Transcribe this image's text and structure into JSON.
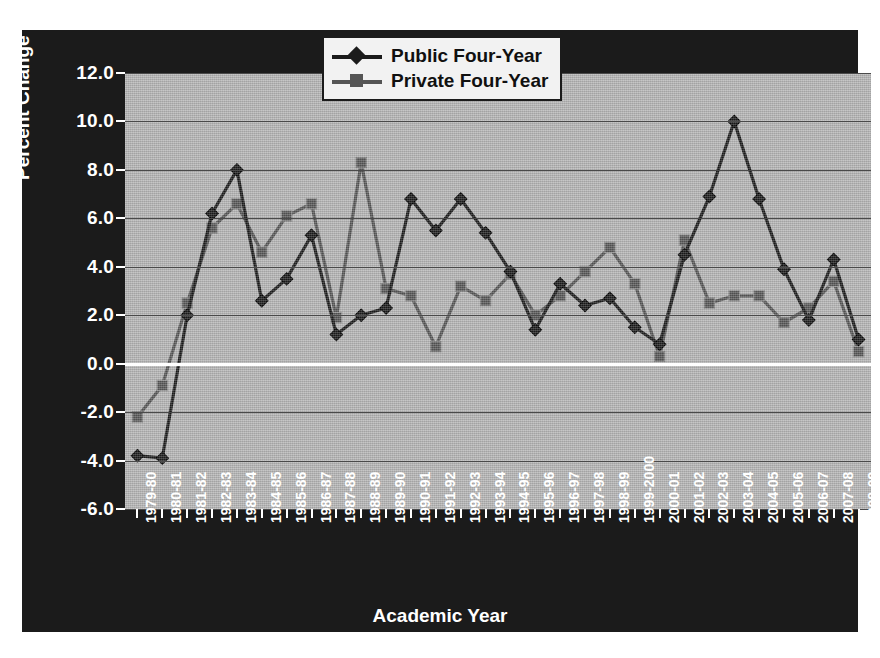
{
  "chart_data": {
    "type": "line",
    "title": "",
    "xlabel": "Academic Year",
    "ylabel": "Percent Change in Inflation-Adjusted Dollars",
    "ylim": [
      -6.0,
      12.0
    ],
    "ytick_step": 2.0,
    "ytick_labels": [
      "12.0",
      "10.0",
      "8.0",
      "6.0",
      "4.0",
      "2.0",
      "0.0",
      "-2.0",
      "-4.0",
      "-6.0"
    ],
    "ytick_values": [
      12.0,
      10.0,
      8.0,
      6.0,
      4.0,
      2.0,
      0.0,
      -2.0,
      -4.0,
      -6.0
    ],
    "grid": true,
    "zero_line": true,
    "legend_position": "top-center",
    "categories": [
      "1979-80",
      "1980-81",
      "1981-82",
      "1982-83",
      "1983-84",
      "1984-85",
      "1985-86",
      "1986-87",
      "1987-88",
      "1988-89",
      "1989-90",
      "1990-91",
      "1991-92",
      "1992-93",
      "1993-94",
      "1994-95",
      "1995-96",
      "1996-97",
      "1997-98",
      "1998-99",
      "1999-2000",
      "2000-01",
      "2001-02",
      "2002-03",
      "2003-04",
      "2004-05",
      "2005-06",
      "2006-07",
      "2007-08",
      "2008-09"
    ],
    "series": [
      {
        "name": "Public Four-Year",
        "marker": "diamond",
        "color": "#1b1b1b",
        "values": [
          -3.8,
          -3.9,
          2.0,
          6.2,
          8.0,
          2.6,
          3.5,
          5.3,
          1.2,
          2.0,
          2.3,
          6.8,
          5.5,
          6.8,
          5.4,
          3.8,
          1.4,
          3.3,
          2.4,
          2.7,
          1.5,
          0.8,
          4.5,
          6.9,
          10.0,
          6.8,
          3.9,
          1.8,
          4.3,
          1.0
        ]
      },
      {
        "name": "Private Four-Year",
        "marker": "square",
        "color": "#555555",
        "values": [
          -2.2,
          -0.9,
          2.5,
          5.6,
          6.6,
          4.6,
          6.1,
          6.6,
          1.9,
          8.3,
          3.1,
          2.8,
          0.7,
          3.2,
          2.6,
          3.7,
          2.0,
          2.8,
          3.8,
          4.8,
          3.3,
          0.3,
          5.1,
          2.5,
          2.8,
          2.8,
          1.7,
          2.3,
          3.4,
          0.5
        ]
      }
    ]
  },
  "axes": {
    "x_title": "Academic Year",
    "y_title": "Percent Change in Inflation-Adjusted Dollars"
  },
  "legend": {
    "items": [
      {
        "label": "Public Four-Year",
        "marker": "diamond-marker",
        "color": "#1b1b1b"
      },
      {
        "label": "Private Four-Year",
        "marker": "square-marker",
        "color": "#555555"
      }
    ]
  },
  "colors": {
    "plot_background": "#b3b3b3",
    "plate_background": "#1b1b1b",
    "gridline": "#4a4a4a",
    "zero_line": "#ffffff",
    "public_series": "#1b1b1b",
    "private_series": "#555555",
    "tick_text": "#ffffff"
  }
}
